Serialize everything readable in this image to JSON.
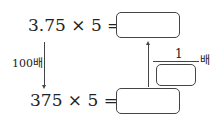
{
  "top_equation": {
    "left": "3.75 × 5 =",
    "answer": ""
  },
  "bottom_equation": {
    "left": "375 × 5 =",
    "answer": ""
  },
  "left_arrow": {
    "label": "100배",
    "direction": "down"
  },
  "right_arrow": {
    "fraction_numerator": "1",
    "fraction_denominator": "",
    "suffix": "배",
    "direction": "up"
  }
}
